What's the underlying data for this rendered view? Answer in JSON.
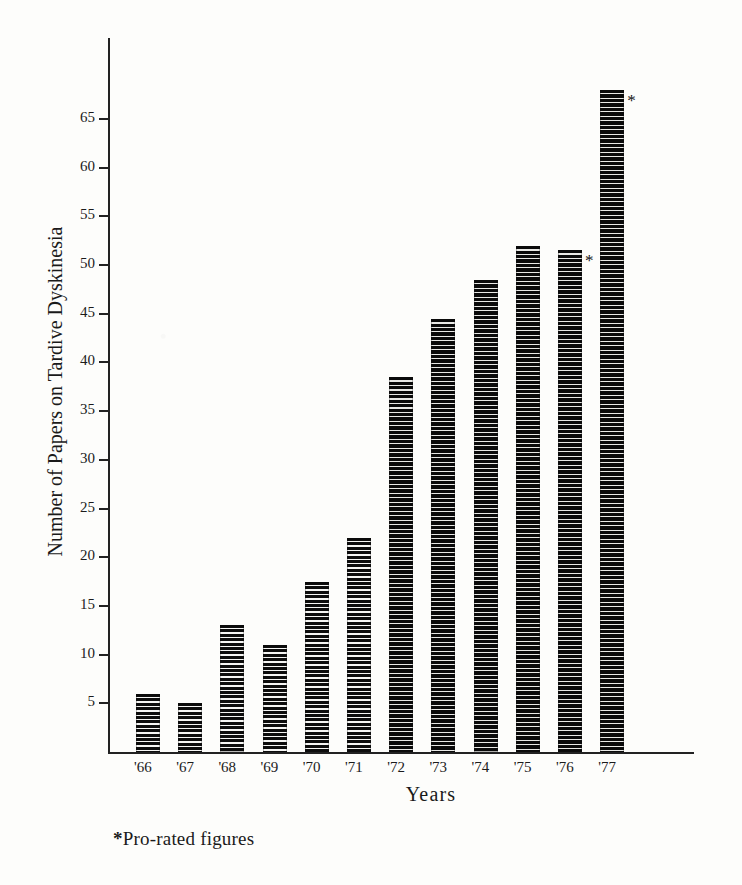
{
  "chart_data": {
    "type": "bar",
    "title": "",
    "xlabel": "Years",
    "ylabel": "Number of Papers on Tardive Dyskinesia",
    "categories": [
      "'66",
      "'67",
      "'68",
      "'69",
      "'70",
      "'71",
      "'72",
      "'73",
      "'74",
      "'75",
      "'76",
      "'77"
    ],
    "values": [
      6,
      5,
      13,
      11,
      17.5,
      22,
      38.5,
      44.5,
      48.5,
      52,
      51.5,
      68
    ],
    "annotations": [
      {
        "category": "'76",
        "marker": "*",
        "note": "Pro-rated figures"
      },
      {
        "category": "'77",
        "marker": "*",
        "note": "Pro-rated figures"
      }
    ],
    "footnote": "*Pro-rated figures",
    "ylim": [
      0,
      70
    ],
    "yticks": [
      5,
      10,
      15,
      20,
      25,
      30,
      35,
      40,
      45,
      50,
      55,
      60,
      65
    ],
    "ytick_labels": [
      "5",
      "10",
      "15",
      "20",
      "25",
      "30",
      "35",
      "40",
      "45",
      "50",
      "55",
      "60",
      "65"
    ],
    "grid": false,
    "legend": "none",
    "bar_fill": "horizontal-hatch",
    "colors": {
      "bar": "#111111",
      "axis": "#222222",
      "background": "#fdfdfb"
    }
  },
  "axes": {
    "y_title": "Number of Papers on Tardive Dyskinesia",
    "x_title": "Years"
  },
  "footnote": {
    "star": "*",
    "text": "Pro-rated figures"
  }
}
